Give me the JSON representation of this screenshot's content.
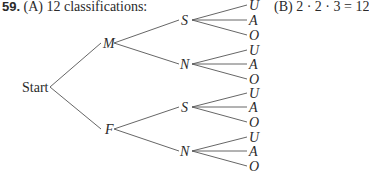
{
  "problem": {
    "number": "59.",
    "part_a": "(A) 12 classifications:",
    "part_b": "(B) 2 · 2 · 3 = 12"
  },
  "tree": {
    "root": {
      "label": "Start",
      "x": 49,
      "y": 87,
      "lx": 22,
      "ly": 92
    },
    "level1": [
      {
        "label": "M",
        "x": 115,
        "y": 43,
        "lx": 103,
        "ly": 48
      },
      {
        "label": "F",
        "x": 115,
        "y": 129,
        "lx": 105,
        "ly": 134
      }
    ],
    "level2": [
      {
        "label": "S",
        "parent": 0,
        "x": 193,
        "y": 20,
        "lx": 181,
        "ly": 25
      },
      {
        "label": "N",
        "parent": 0,
        "x": 193,
        "y": 64,
        "lx": 180,
        "ly": 69
      },
      {
        "label": "S",
        "parent": 1,
        "x": 193,
        "y": 107,
        "lx": 181,
        "ly": 112
      },
      {
        "label": "N",
        "parent": 1,
        "x": 193,
        "y": 151,
        "lx": 180,
        "ly": 156
      }
    ],
    "leaves": [
      {
        "label": "U",
        "parent": 0,
        "y": 5
      },
      {
        "label": "A",
        "parent": 0,
        "y": 20
      },
      {
        "label": "O",
        "parent": 0,
        "y": 35
      },
      {
        "label": "U",
        "parent": 1,
        "y": 50
      },
      {
        "label": "A",
        "parent": 1,
        "y": 64
      },
      {
        "label": "O",
        "parent": 1,
        "y": 79
      },
      {
        "label": "U",
        "parent": 2,
        "y": 93
      },
      {
        "label": "A",
        "parent": 2,
        "y": 107
      },
      {
        "label": "O",
        "parent": 2,
        "y": 122
      },
      {
        "label": "U",
        "parent": 3,
        "y": 137
      },
      {
        "label": "A",
        "parent": 3,
        "y": 151
      },
      {
        "label": "O",
        "parent": 3,
        "y": 166
      }
    ],
    "leaf_x": 249
  }
}
